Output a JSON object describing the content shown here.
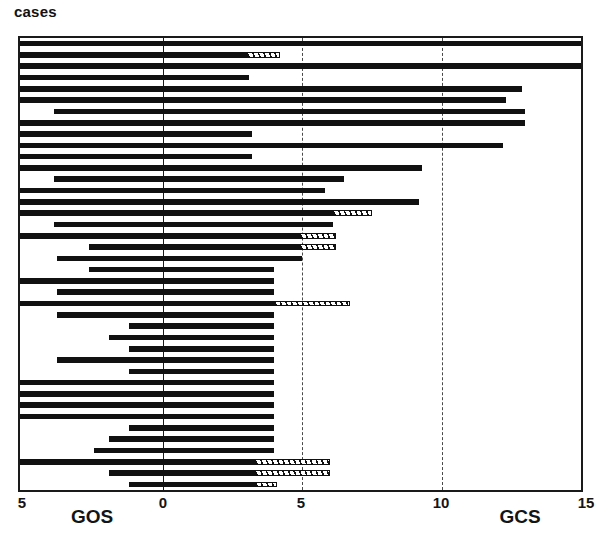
{
  "title": "cases",
  "chart_data": {
    "type": "bar",
    "orientation": "horizontal",
    "style": "bidirectional-population-pyramid",
    "title": "cases",
    "xlabel": "",
    "ylabel": "cases",
    "grid": "vertical dashed gridlines at GCS 5 and 10",
    "legend": null,
    "axes": [
      {
        "name": "GOS",
        "side": "left",
        "label": "GOS",
        "direction": "right-to-left",
        "ticks": [
          5,
          0
        ],
        "tick_labels": [
          "5",
          "0"
        ],
        "lim": [
          5,
          0
        ]
      },
      {
        "name": "GCS",
        "side": "right",
        "label": "GCS",
        "direction": "left-to-right",
        "ticks": [
          0,
          5,
          10,
          15
        ],
        "tick_labels": [
          "0",
          "5",
          "10",
          "15"
        ],
        "lim": [
          0,
          15
        ]
      }
    ],
    "axis_tick_text": {
      "far_left": "5",
      "left_name": "GOS",
      "center": "0",
      "mid": "5",
      "upper": "10",
      "right_name": "GCS",
      "far_right": "15"
    },
    "series": [
      {
        "name": "GOS",
        "axis": "left",
        "fill": "solid-black"
      },
      {
        "name": "GCS (scored)",
        "axis": "right",
        "fill": "solid-black"
      },
      {
        "name": "GCS (estimated)",
        "axis": "right",
        "fill": "hatched-open"
      }
    ],
    "n_cases": 32,
    "cases": [
      {
        "gos": 5.0,
        "gcs": 15.0,
        "gcs_hatch": 0.0
      },
      {
        "gos": 5.0,
        "gcs": 3.0,
        "gcs_hatch": 1.2
      },
      {
        "gos": 5.0,
        "gcs": 15.0,
        "gcs_hatch": 0.0
      },
      {
        "gos": 5.0,
        "gcs": 3.1,
        "gcs_hatch": 0.0
      },
      {
        "gos": 5.0,
        "gcs": 12.9,
        "gcs_hatch": 0.0
      },
      {
        "gos": 5.0,
        "gcs": 12.3,
        "gcs_hatch": 0.0
      },
      {
        "gos": 3.8,
        "gcs": 13.0,
        "gcs_hatch": 0.0
      },
      {
        "gos": 5.0,
        "gcs": 13.0,
        "gcs_hatch": 0.0
      },
      {
        "gos": 5.0,
        "gcs": 3.2,
        "gcs_hatch": 0.0
      },
      {
        "gos": 5.0,
        "gcs": 12.2,
        "gcs_hatch": 0.0
      },
      {
        "gos": 5.0,
        "gcs": 3.2,
        "gcs_hatch": 0.0
      },
      {
        "gos": 5.0,
        "gcs": 9.3,
        "gcs_hatch": 0.0
      },
      {
        "gos": 3.8,
        "gcs": 6.5,
        "gcs_hatch": 0.0
      },
      {
        "gos": 5.0,
        "gcs": 5.8,
        "gcs_hatch": 0.0
      },
      {
        "gos": 5.0,
        "gcs": 9.2,
        "gcs_hatch": 0.0
      },
      {
        "gos": 5.0,
        "gcs": 6.1,
        "gcs_hatch": 1.4
      },
      {
        "gos": 3.8,
        "gcs": 6.1,
        "gcs_hatch": 0.0
      },
      {
        "gos": 5.0,
        "gcs": 4.9,
        "gcs_hatch": 1.3
      },
      {
        "gos": 2.6,
        "gcs": 4.9,
        "gcs_hatch": 1.3
      },
      {
        "gos": 3.7,
        "gcs": 5.0,
        "gcs_hatch": 0.0
      },
      {
        "gos": 2.6,
        "gcs": 4.0,
        "gcs_hatch": 0.0
      },
      {
        "gos": 5.0,
        "gcs": 4.0,
        "gcs_hatch": 0.0
      },
      {
        "gos": 3.7,
        "gcs": 4.0,
        "gcs_hatch": 0.0
      },
      {
        "gos": 5.0,
        "gcs": 4.0,
        "gcs_hatch": 2.7
      },
      {
        "gos": 3.7,
        "gcs": 4.0,
        "gcs_hatch": 0.0
      },
      {
        "gos": 1.2,
        "gcs": 4.0,
        "gcs_hatch": 0.0
      },
      {
        "gos": 1.9,
        "gcs": 4.0,
        "gcs_hatch": 0.0
      },
      {
        "gos": 1.2,
        "gcs": 4.0,
        "gcs_hatch": 0.0
      },
      {
        "gos": 3.7,
        "gcs": 4.0,
        "gcs_hatch": 0.0
      },
      {
        "gos": 1.2,
        "gcs": 4.0,
        "gcs_hatch": 0.0
      },
      {
        "gos": 5.0,
        "gcs": 4.0,
        "gcs_hatch": 0.0
      },
      {
        "gos": 5.0,
        "gcs": 4.0,
        "gcs_hatch": 0.0
      },
      {
        "gos": 5.0,
        "gcs": 4.0,
        "gcs_hatch": 0.0
      },
      {
        "gos": 5.0,
        "gcs": 4.0,
        "gcs_hatch": 0.0
      },
      {
        "gos": 1.2,
        "gcs": 4.0,
        "gcs_hatch": 0.0
      },
      {
        "gos": 1.9,
        "gcs": 4.0,
        "gcs_hatch": 0.0
      },
      {
        "gos": 2.4,
        "gcs": 4.0,
        "gcs_hatch": 0.0
      },
      {
        "gos": 5.0,
        "gcs": 3.3,
        "gcs_hatch": 2.7
      },
      {
        "gos": 1.9,
        "gcs": 3.3,
        "gcs_hatch": 2.7
      },
      {
        "gos": 1.2,
        "gcs": 3.3,
        "gcs_hatch": 0.8
      }
    ],
    "gridlines": [
      5,
      10
    ]
  },
  "geometry": {
    "plot_left_value": 5,
    "plot_center_value": 0,
    "plot_right_value": 15
  }
}
